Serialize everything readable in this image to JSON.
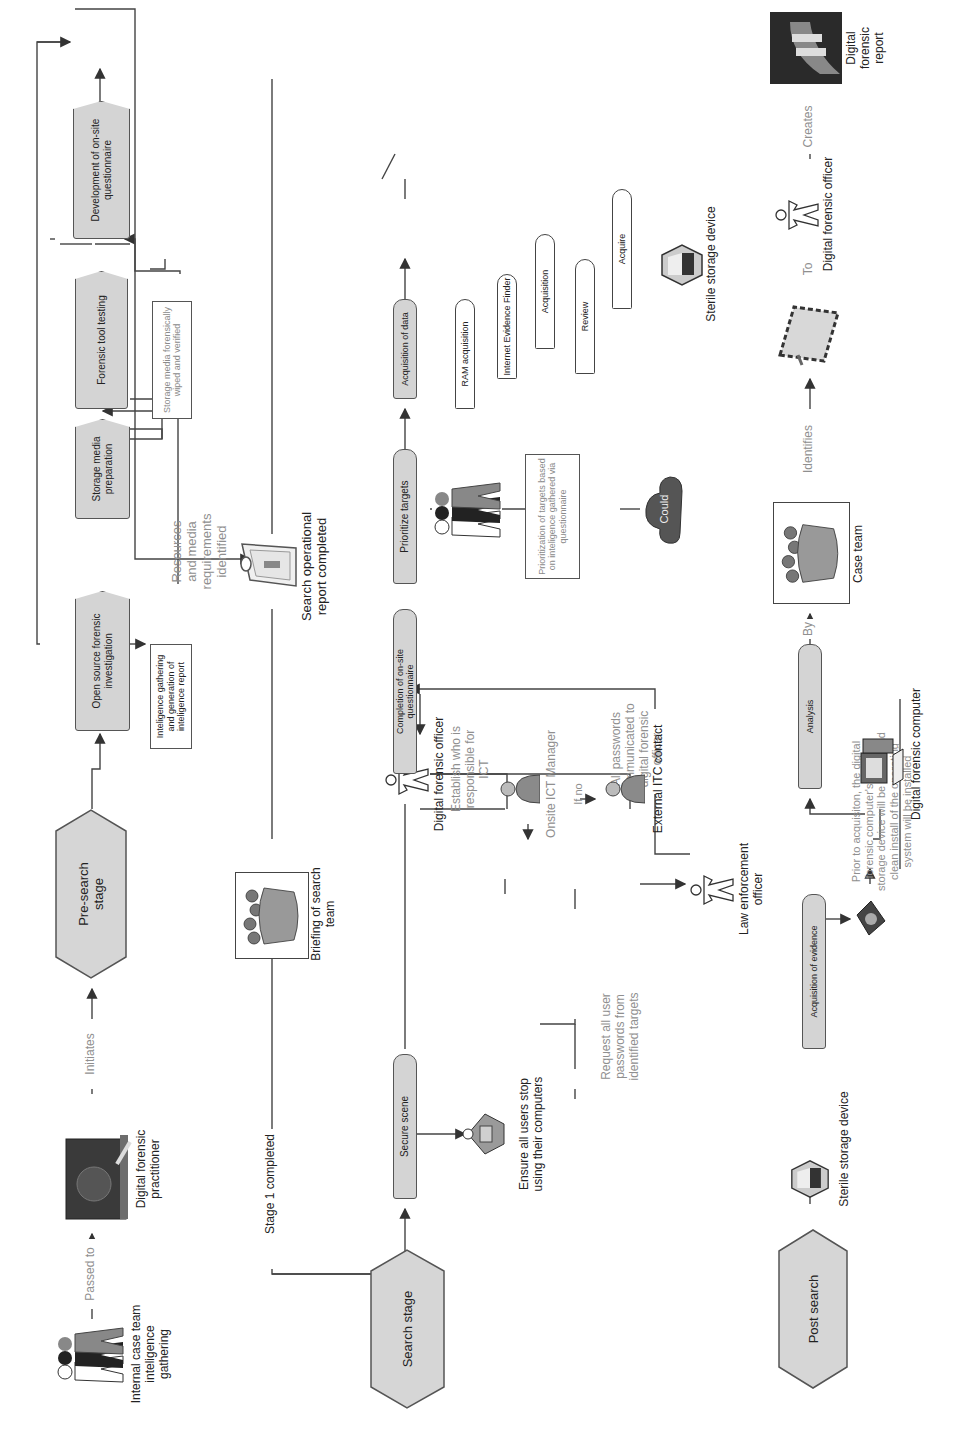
{
  "diagram": {
    "orientation": "rotated-90-ccw",
    "colors": {
      "process_fill": "#d4d4d4",
      "stroke": "#555555",
      "label_grey": "#8f8f8f",
      "text": "#222222"
    }
  },
  "pre_search": {
    "actor_team": "Internal case team inteligence gathering",
    "edge_passed_to": "Passed to",
    "actor_practitioner": "Digital forensic practitioner",
    "edge_initiates": "Initiates",
    "stage": "Pre-search stage",
    "open_source": "Open source forensic investigation",
    "intel_note": "Inteligence gathering and generation of inteligence report",
    "resources_label": "Resources and media requirements identified",
    "storage_prep": "Storage media preparation",
    "storage_note": "Storage media forensically wiped and verified",
    "tool_testing": "Forensic tool testing",
    "questionnaire_dev": "Development of on-site questionnaire"
  },
  "transition": {
    "stage1": "Stage 1 completed",
    "briefing": "Briefing of search team",
    "report": "Search operational report completed"
  },
  "search": {
    "stage": "Search stage",
    "secure_scene": "Secure scene",
    "ensure_users": "Ensure all users stop using their computers",
    "request_passwords": "Request all user passwords from identified targets",
    "law_officer": "Law enforcement officer",
    "passwords_communicated": "All passwords communicated to digital forensic officer",
    "forensic_officer": "Digital forensic officer",
    "establish_ict": "Establish who is responsible for ICT",
    "onsite_ict": "Onsite ICT Manager",
    "if_no": "If no",
    "external_itc": "External ITC contact",
    "completion": "Completion of on-site questionnaire",
    "prioritize": "Prioritize targets",
    "prioritize_note": "Prioritization of targets based on inteligence gathered via questionnaire",
    "cloud": "Could",
    "acquisition_data": "Acquisition of data",
    "ram": "RAM acquisition",
    "internet_finder": "Internet Evidence Finder",
    "acquisition": "Acquisition",
    "review": "Review",
    "acquire": "Acquire",
    "sterile_device": "Sterile storage device"
  },
  "post_search": {
    "stage": "Post search",
    "sterile_device": "Sterile storage device",
    "acquisition_evidence": "Acquisition of evidence",
    "prior_note": "Prior to acquisiton, the digital forensic computer's internal storage device will be sterile and clean install of the operating system will be installed",
    "forensic_computer": "Digital forensic computer",
    "analysis": "Analysis",
    "edge_by": "By",
    "case_team": "Case team",
    "edge_identifies": "Identifies",
    "edge_to": "To",
    "forensic_officer": "Digital forensic officer",
    "edge_creates": "Creates",
    "report": "Digital forensic report"
  }
}
